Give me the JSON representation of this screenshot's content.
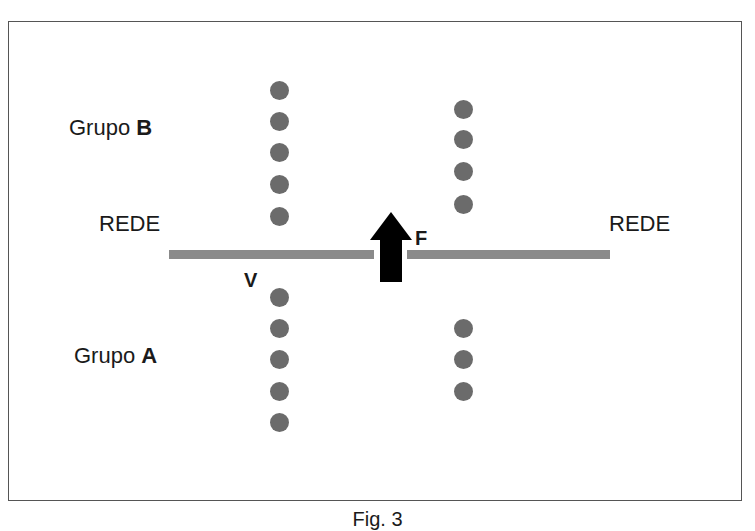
{
  "figure": {
    "caption": "Fig. 3",
    "labels": {
      "group_b_prefix": "Grupo ",
      "group_b_letter": "B",
      "group_a_prefix": "Grupo ",
      "group_a_letter": "A",
      "net_left": "REDE",
      "net_right": "REDE",
      "force": "F",
      "v_label": "V"
    },
    "dots": {
      "color": "#6b6b6b",
      "group_b_left_column": {
        "x": 279,
        "y": [
          90,
          121,
          152,
          184,
          216
        ]
      },
      "group_b_right_column": {
        "x": 463,
        "y": [
          109,
          139,
          171,
          204
        ]
      },
      "group_a_left_column": {
        "x": 279,
        "y": [
          297,
          328,
          359,
          391,
          422
        ]
      },
      "group_a_right_column": {
        "x": 463,
        "y": [
          328,
          359,
          391
        ]
      }
    },
    "net_color": "#8a8a8a",
    "arrow_color": "#000000"
  }
}
